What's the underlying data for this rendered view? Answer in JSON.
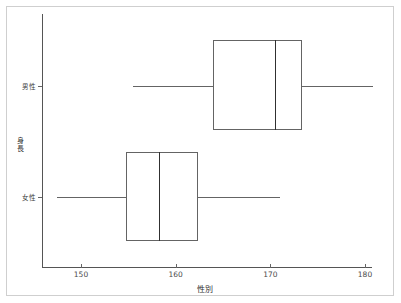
{
  "chart_data": {
    "type": "box",
    "title": "",
    "xlabel": "性別",
    "ylabel": "身長",
    "orientation": "horizontal",
    "grid": false,
    "legend": null,
    "xlim": [
      145.5,
      181.8
    ],
    "xticks": [
      150,
      160,
      170,
      180
    ],
    "xtick_labels": [
      "150",
      "160",
      "170",
      "180"
    ],
    "categories": [
      "男性",
      "女性"
    ],
    "boxes": [
      {
        "category": "男性",
        "whisker_low": 155.5,
        "q1": 163.9,
        "median": 170.5,
        "q3": 173.3,
        "whisker_high": 180.8
      },
      {
        "category": "女性",
        "whisker_low": 147.5,
        "q1": 154.8,
        "median": 158.2,
        "q3": 162.4,
        "whisker_high": 171.0
      }
    ],
    "colors": {
      "box_edge": "#646464",
      "median": "#303030",
      "whisker": "#646464",
      "axis": "#555555",
      "frame": "#cfcfcf",
      "background": "#ffffff"
    }
  }
}
